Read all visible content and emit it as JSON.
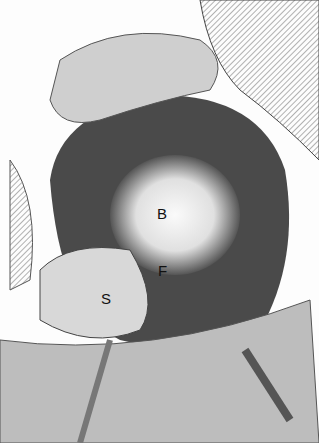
{
  "figure": {
    "labels": [
      {
        "id": "B",
        "text": "B",
        "x": 157,
        "y": 205
      },
      {
        "id": "F",
        "text": "F",
        "x": 158,
        "y": 262
      },
      {
        "id": "S",
        "text": "S",
        "x": 101,
        "y": 290
      }
    ],
    "colors": {
      "background": "#fdfdfd",
      "shade_dark": "#3a3a3a",
      "shade_mid": "#888888",
      "highlight": "#f5f5f5"
    }
  }
}
